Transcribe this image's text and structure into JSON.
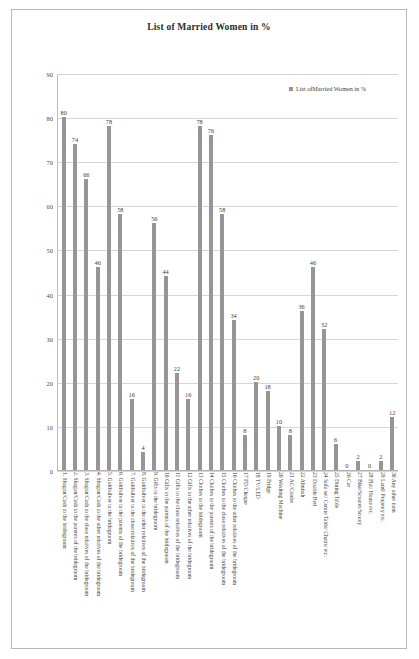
{
  "chart_data": {
    "type": "bar",
    "title": "List of Married Women in  %",
    "xlabel": "",
    "ylabel": "",
    "ylim": [
      0,
      90
    ],
    "yticks": [
      90,
      80,
      70,
      60,
      50,
      40,
      30,
      20,
      10,
      0
    ],
    "grid": true,
    "legend_position": "top-right",
    "legend": [
      "List ofMarried Women in  %"
    ],
    "series_color": "#969696",
    "categories": [
      "1.   Shagun/Cash  to the bridegroom",
      "2.   Shagun/Cash to the parents of the bridegroom",
      "3.  Shagun/Cash to the close relatives of the bridegroom",
      "4.  Shagun/Cash to the other relatives of the bridegroom",
      "5.   Gold/silver to the bridegroom",
      "6.   Gold/silver to the parents of the bridegroom",
      "7.  Gold/silver to the close relatives of the bridegroom",
      "8.  Gold/silver to the other relatives of the bridegroom",
      "9.   Gifts to the bridegroom",
      "10  Gifts to the parents of the bridegroom",
      "11  Gifts to the close relatives of the bridegroom",
      "12  Gifts to the other relatives of the bridegroom",
      "13  Clothes to the bridegroom",
      "14  Clothes to the parents of the bridegroom",
      "15  Clothes to the close relatives of the bridegroom",
      "16  Clothes to the other relatives of the bridegroom",
      "17  FD/Cheque",
      "18  TV/LED",
      "19  Fridge",
      "20  Washing Machine",
      "21  AC/Cooler",
      "22  Almirah",
      "23  Double Bed",
      "24  Sofa set/ Centre Table/ Chairs/ etc.",
      "25  Dining Table",
      "26  Car",
      "27  Bike/Scooter/Scooty",
      "28  Flat/ House etc.",
      "29  Land/ Property etc.",
      "30  Any other item"
    ],
    "values": [
      80,
      74,
      66,
      46,
      78,
      58,
      16,
      4,
      56,
      44,
      22,
      16,
      78,
      76,
      58,
      34,
      8,
      20,
      18,
      10,
      8,
      36,
      46,
      32,
      6,
      0,
      2,
      0,
      2,
      12
    ]
  }
}
